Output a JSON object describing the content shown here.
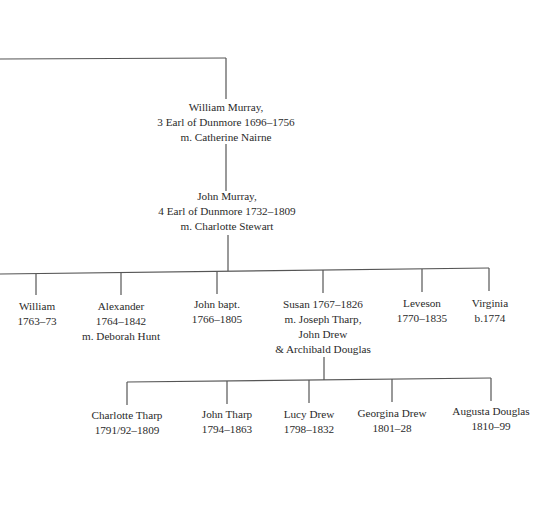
{
  "tree": {
    "gen1": {
      "name": "William Murray,",
      "title": "3 Earl of Dunmore 1696–1756",
      "spouse": "m. Catherine Nairne"
    },
    "gen2": {
      "name": "John Murray,",
      "title": "4 Earl of Dunmore 1732–1809",
      "spouse": "m. Charlotte Stewart"
    },
    "children": [
      {
        "line1": "William",
        "line2": "1763–73"
      },
      {
        "line1": "Alexander",
        "line2": "1764–1842",
        "line3": "m. Deborah Hunt"
      },
      {
        "line1": "John bapt.",
        "line2": "1766–1805"
      },
      {
        "line1": "Susan 1767–1826",
        "line2": "m. Joseph Tharp,",
        "line3": "John Drew",
        "line4": "& Archibald Douglas"
      },
      {
        "line1": "Leveson",
        "line2": "1770–1835"
      },
      {
        "line1": "Virginia",
        "line2": "b.1774"
      }
    ],
    "grandchildren": [
      {
        "line1": "Charlotte Tharp",
        "line2": "1791/92–1809"
      },
      {
        "line1": "John Tharp",
        "line2": "1794–1863"
      },
      {
        "line1": "Lucy Drew",
        "line2": "1798–1832"
      },
      {
        "line1": "Georgina Drew",
        "line2": "1801–28"
      },
      {
        "line1": "Augusta Douglas",
        "line2": "1810–99"
      }
    ]
  }
}
